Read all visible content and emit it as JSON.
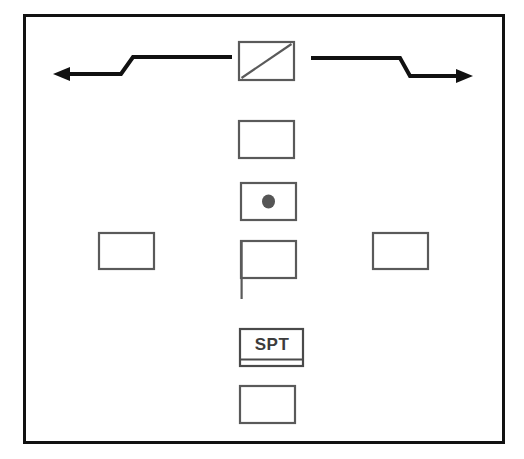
{
  "diagram": {
    "background_color": "#ffffff",
    "frame": {
      "label": "outer-frame",
      "stroke_color": "#111111",
      "x": 23,
      "y": 14,
      "width": 481,
      "height": 429,
      "stroke_width": 3
    },
    "stroke_color": "#555555",
    "arrow_color": "#111111",
    "dot_color": "#555555",
    "nodes": [
      {
        "id": "top-diagonal-box",
        "label": "",
        "marker": "diagonal-line",
        "x": 238,
        "y": 41,
        "width": 56,
        "height": 39
      },
      {
        "id": "second-box",
        "label": "",
        "marker": "none",
        "x": 238,
        "y": 120,
        "width": 56,
        "height": 38
      },
      {
        "id": "dot-box",
        "label": "",
        "marker": "filled-dot",
        "x": 240,
        "y": 182,
        "width": 56,
        "height": 38
      },
      {
        "id": "flag-box",
        "label": "",
        "marker": "flag-pole",
        "x": 240,
        "y": 240,
        "width": 56,
        "height": 38
      },
      {
        "id": "spt-box",
        "label": "SPT",
        "marker": "bottom-divider",
        "x": 240,
        "y": 328,
        "width": 64,
        "height": 38
      },
      {
        "id": "bottom-box",
        "label": "",
        "marker": "none",
        "x": 240,
        "y": 385,
        "width": 56,
        "height": 38
      },
      {
        "id": "left-box",
        "label": "",
        "marker": "none",
        "x": 98,
        "y": 232,
        "width": 56,
        "height": 37
      },
      {
        "id": "right-box",
        "label": "",
        "marker": "none",
        "x": 372,
        "y": 232,
        "width": 56,
        "height": 37
      }
    ],
    "arrows": [
      {
        "id": "left-zigzag-arrow",
        "direction": "left",
        "points": "232,58 133,58 122,74 58,74",
        "head_at": "55,74"
      },
      {
        "id": "right-zigzag-arrow",
        "direction": "right",
        "points": "311,59 400,59 409,76 468,76",
        "head_at": "471,76"
      }
    ]
  }
}
